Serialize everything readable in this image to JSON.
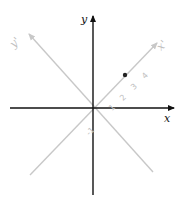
{
  "diagram": {
    "title": "",
    "colors": {
      "primary_axis": "#111111",
      "rotated_axis": "#c8c8c8",
      "rotated_label": "#c0c0c0",
      "point": "#222222"
    },
    "axes": {
      "x": {
        "label": "x"
      },
      "y": {
        "label": "y"
      },
      "x_prime": {
        "label": "x'"
      },
      "y_prime": {
        "label": "y'"
      }
    },
    "x_prime_ticks": [
      "1",
      "2",
      "3",
      "4"
    ],
    "negative_tick": "-1",
    "point": {
      "axis": "x'",
      "position": 3.5
    }
  }
}
